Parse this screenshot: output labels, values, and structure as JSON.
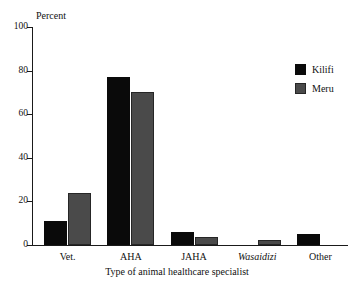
{
  "chart_data": {
    "type": "bar",
    "title": "",
    "xlabel": "Type of animal healthcare specialist",
    "ylabel": "Percent",
    "ylim": [
      0,
      100
    ],
    "ytick_labels": [
      "100",
      "80",
      "60",
      "40",
      "20",
      "0"
    ],
    "yticks": [
      100,
      80,
      60,
      40,
      20,
      0
    ],
    "grid": false,
    "legend_position": "top-right",
    "categories": [
      "Vet.",
      "AHA",
      "JAHA",
      "Wasaidizi",
      "Other"
    ],
    "categories_italic": [
      false,
      false,
      false,
      true,
      false
    ],
    "series": [
      {
        "name": "Kilifi",
        "color": "#0a0a0a",
        "values": [
          11,
          77,
          6,
          0,
          5
        ]
      },
      {
        "name": "Meru",
        "color": "#4a4a4a",
        "values": [
          24,
          70,
          3.5,
          2.5,
          0
        ]
      }
    ]
  }
}
